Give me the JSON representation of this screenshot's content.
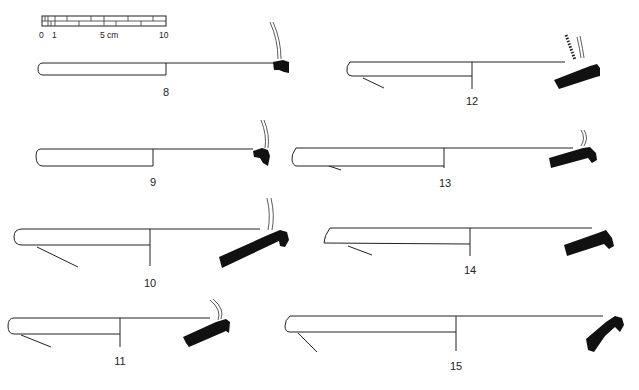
{
  "figure": {
    "type": "archaeological pottery profile plate (plate/dish rim sections)",
    "scale_bar": {
      "labels": [
        "0",
        "1",
        "5 cm",
        "10"
      ],
      "units": "cm",
      "length_cm": 10
    },
    "profiles": [
      {
        "id": "8",
        "label": "8"
      },
      {
        "id": "9",
        "label": "9"
      },
      {
        "id": "10",
        "label": "10"
      },
      {
        "id": "11",
        "label": "11"
      },
      {
        "id": "12",
        "label": "12"
      },
      {
        "id": "13",
        "label": "13"
      },
      {
        "id": "14",
        "label": "14"
      },
      {
        "id": "15",
        "label": "15"
      }
    ]
  }
}
